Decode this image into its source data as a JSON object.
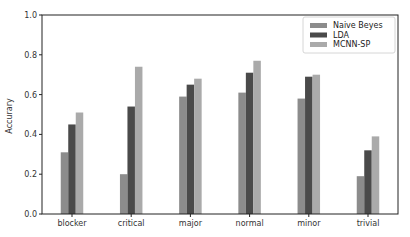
{
  "chart_data": {
    "type": "bar",
    "title": "",
    "xlabel": "",
    "ylabel": "Accurary",
    "ylim": [
      0.0,
      1.0
    ],
    "yticks": [
      "0.0",
      "0.2",
      "0.4",
      "0.6",
      "0.8",
      "1.0"
    ],
    "grid": false,
    "legend_position": "upper right",
    "categories": [
      "blocker",
      "critical",
      "major",
      "normal",
      "minor",
      "trivial"
    ],
    "series": [
      {
        "name": "Naive Beyes",
        "color": "#8c8c8c",
        "values": [
          0.31,
          0.2,
          0.59,
          0.61,
          0.58,
          0.19
        ]
      },
      {
        "name": "LDA",
        "color": "#4a4a4a",
        "values": [
          0.45,
          0.54,
          0.65,
          0.71,
          0.69,
          0.32
        ]
      },
      {
        "name": "MCNN-SP",
        "color": "#aaaaaa",
        "values": [
          0.51,
          0.74,
          0.68,
          0.77,
          0.7,
          0.39
        ]
      }
    ]
  }
}
